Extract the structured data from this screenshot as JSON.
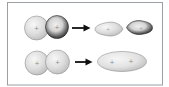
{
  "canvas": {
    "background": "#ffffff",
    "frame_border": "#9aa0a6"
  },
  "colors": {
    "sphere_light_hi": "#f7f7f7",
    "sphere_light_mid": "#dedede",
    "sphere_light_edge": "#bbbbbb",
    "outline_gray": "#7e7e7e",
    "dark_center": "#efefef",
    "dark_soft": "#d4d4d4",
    "dark_ring": "#5a5a5a",
    "dark_rim": "#141414",
    "ellipse_hi": "#f6f6f6",
    "ellipse_mid": "#e2e2e2",
    "ellipse_edge": "#b2b2b2",
    "arrow": "#101010",
    "plus_mark": "#7a7a7a"
  },
  "symbols": {
    "plus": "+"
  },
  "figure": {
    "row1": {
      "reactant_icons": [
        "s-orbital-light-icon",
        "s-orbital-dark-icon"
      ],
      "operator_icon": "arrow-right-icon",
      "product_icons": [
        "antibonding-lobe-light-icon",
        "antibonding-lobe-dark-icon"
      ]
    },
    "row2": {
      "reactant_icons": [
        "s-orbital-light-icon",
        "s-orbital-light-icon"
      ],
      "operator_icon": "arrow-right-icon",
      "product_icons": [
        "bonding-orbital-ellipse-icon"
      ]
    }
  }
}
